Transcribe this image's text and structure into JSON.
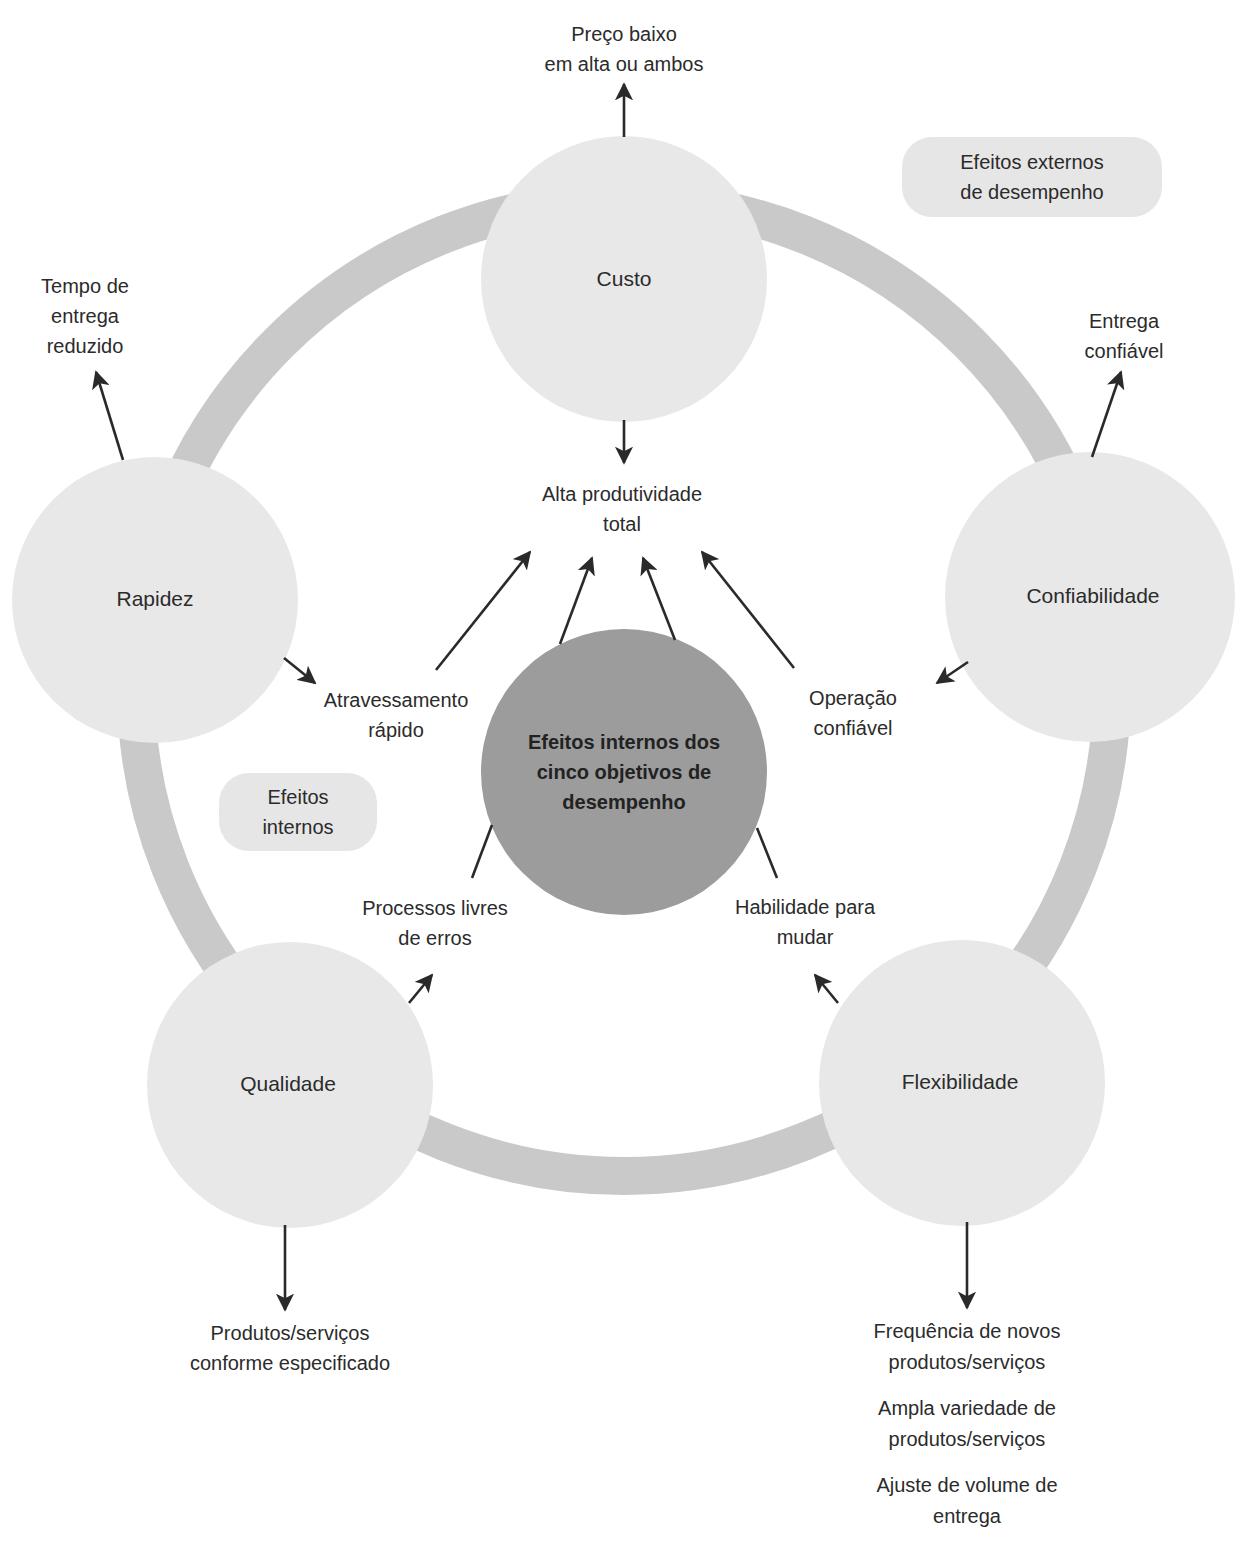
{
  "diagram": {
    "title": "Efeitos internos dos cinco objetivos de desempenho",
    "colors": {
      "ring": "#c9c9c9",
      "objective_circle": "#e8e8e8",
      "center_circle": "#9a9a9a",
      "pill": "#e6e6e6",
      "arrow": "#2a2a2a",
      "text": "#2b2b2b"
    },
    "center": {
      "label_lines": [
        "Efeitos internos dos",
        "cinco objetivos de",
        "desempenho"
      ]
    },
    "hub": {
      "label_lines": [
        "Alta produtividade",
        "total"
      ]
    },
    "legend_pills": {
      "external": {
        "label_lines": [
          "Efeitos externos",
          "de desempenho"
        ]
      },
      "internal": {
        "label_lines": [
          "Efeitos",
          "internos"
        ]
      }
    },
    "objectives": [
      {
        "id": "custo",
        "label": "Custo",
        "external_effect": [
          "Preço baixo",
          "em alta ou ambos"
        ],
        "internal_effect": [
          "Alta produtividade",
          "total"
        ]
      },
      {
        "id": "rapidez",
        "label": "Rapidez",
        "external_effect": [
          "Tempo de",
          "entrega",
          "reduzido"
        ],
        "internal_effect": [
          "Atravessamento",
          "rápido"
        ]
      },
      {
        "id": "confiabilidade",
        "label": "Confiabilidade",
        "external_effect": [
          "Entrega",
          "confiável"
        ],
        "internal_effect": [
          "Operação",
          "confiável"
        ]
      },
      {
        "id": "qualidade",
        "label": "Qualidade",
        "external_effect": [
          "Produtos/serviços",
          "conforme especificado"
        ],
        "internal_effect": [
          "Processos livres",
          "de erros"
        ]
      },
      {
        "id": "flexibilidade",
        "label": "Flexibilidade",
        "external_effect_groups": [
          [
            "Frequência de novos",
            "produtos/serviços"
          ],
          [
            "Ampla variedade de",
            "produtos/serviços"
          ],
          [
            "Ajuste de volume de",
            "entrega"
          ]
        ],
        "internal_effect": [
          "Habilidade para",
          "mudar"
        ]
      }
    ]
  }
}
